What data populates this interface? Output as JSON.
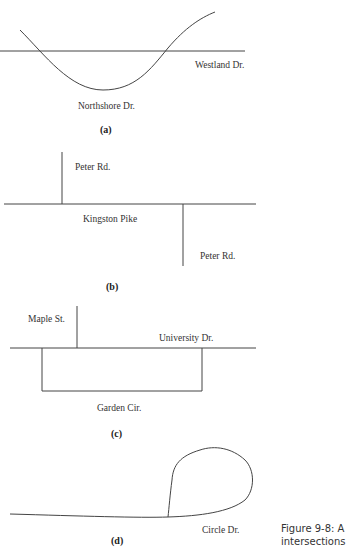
{
  "figure": {
    "caption_line1": "Figure 9-8:  A",
    "caption_line2": "intersections"
  },
  "panels": [
    {
      "id": "a",
      "label": "(a)",
      "streets": [
        "Westland Dr.",
        "Northshore Dr."
      ]
    },
    {
      "id": "b",
      "label": "(b)",
      "streets": [
        "Peter Rd.",
        "Kingston Pike",
        "Peter Rd."
      ]
    },
    {
      "id": "c",
      "label": "(c)",
      "streets": [
        "Maple St.",
        "University Dr.",
        "Garden Cir."
      ]
    },
    {
      "id": "d",
      "label": "(d)",
      "streets": [
        "Circle Dr."
      ]
    }
  ],
  "colors": {
    "line": "#333333",
    "background": "#ffffff"
  }
}
